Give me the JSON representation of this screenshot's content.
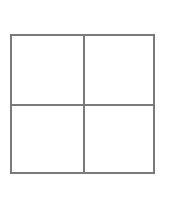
{
  "figure": {
    "shape": "grid",
    "rows": 2,
    "columns": 2,
    "line_color": "#7a7a7a",
    "background": "#ffffff",
    "cells": [
      {
        "row": 0,
        "col": 0,
        "content": ""
      },
      {
        "row": 0,
        "col": 1,
        "content": ""
      },
      {
        "row": 1,
        "col": 0,
        "content": ""
      },
      {
        "row": 1,
        "col": 1,
        "content": ""
      }
    ]
  }
}
